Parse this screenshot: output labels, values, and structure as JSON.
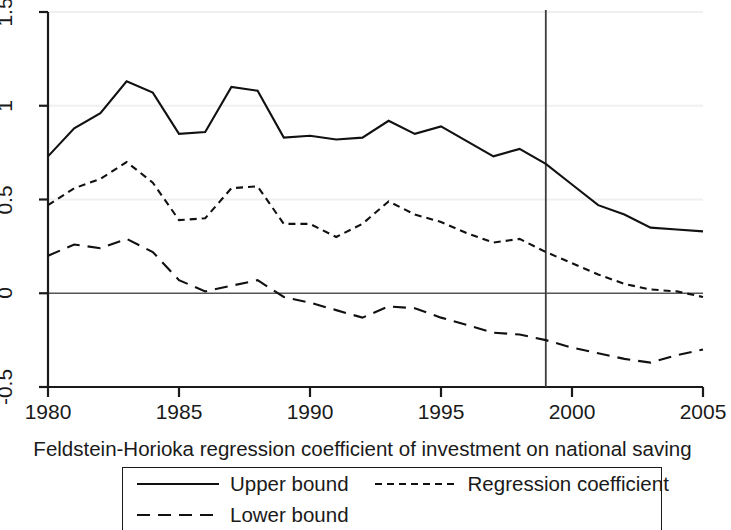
{
  "chart_data": {
    "type": "line",
    "title": "",
    "xlabel": "Feldstein-Horioka regression coefficient of investment on national saving",
    "ylabel": "",
    "xlim": [
      1980,
      2005
    ],
    "ylim": [
      -0.5,
      1.5
    ],
    "grid": true,
    "legend_position": "bottom",
    "xticks": [
      "1980",
      "1985",
      "1990",
      "1995",
      "2000",
      "2005"
    ],
    "xtick_values": [
      1980,
      1985,
      1990,
      1995,
      2000,
      2005
    ],
    "yticks": [
      "1.5",
      "1",
      "0.5",
      "0",
      "-0.5"
    ],
    "ytick_values": [
      1.5,
      1,
      0.5,
      0,
      -0.5
    ],
    "gridline_values": [
      1.5,
      1,
      0.5,
      -0.5
    ],
    "zero_line_value": 0,
    "reference_line": {
      "x": 1999,
      "label": ""
    },
    "x": [
      1980,
      1981,
      1982,
      1983,
      1984,
      1985,
      1986,
      1987,
      1988,
      1989,
      1990,
      1991,
      1992,
      1993,
      1994,
      1995,
      1996,
      1997,
      1998,
      1999,
      2000,
      2001,
      2002,
      2003,
      2004,
      2005
    ],
    "series": [
      {
        "name": "Upper bound",
        "style": "solid",
        "values": [
          0.73,
          0.88,
          0.96,
          1.13,
          1.07,
          0.85,
          0.86,
          1.1,
          1.08,
          0.83,
          0.84,
          0.82,
          0.83,
          0.92,
          0.85,
          0.89,
          0.81,
          0.73,
          0.77,
          0.69,
          0.58,
          0.47,
          0.42,
          0.35,
          0.34,
          0.33
        ],
        "values_full": [
          0.73,
          0.88,
          0.96,
          1.13,
          1.07,
          0.85,
          0.86,
          1.1,
          1.08,
          0.83,
          0.84,
          0.82,
          0.83,
          0.92,
          0.85,
          0.89,
          0.81,
          0.73,
          0.77,
          0.69,
          0.58,
          0.47,
          0.42,
          0.35,
          0.34,
          0.33
        ]
      },
      {
        "name": "Regression coefficient",
        "style": "dotted",
        "values": [
          0.47,
          0.56,
          0.61,
          0.7,
          0.59,
          0.39,
          0.4,
          0.56,
          0.57,
          0.37,
          0.37,
          0.3,
          0.37,
          0.49,
          0.42,
          0.38,
          0.32,
          0.27,
          0.29,
          0.22,
          0.16,
          0.1,
          0.05,
          0.02,
          0.01,
          -0.02
        ]
      },
      {
        "name": "Lower bound",
        "style": "dashed",
        "values": [
          0.2,
          0.26,
          0.24,
          0.29,
          0.22,
          0.07,
          0.01,
          0.04,
          0.07,
          -0.02,
          -0.05,
          -0.09,
          -0.13,
          -0.07,
          -0.08,
          -0.13,
          -0.17,
          -0.21,
          -0.22,
          -0.25,
          -0.29,
          -0.32,
          -0.35,
          -0.37,
          -0.33,
          -0.3
        ]
      }
    ]
  },
  "series_points": {
    "upper": [
      [
        1980,
        0.73
      ],
      [
        1981,
        0.88
      ],
      [
        1982,
        0.96
      ],
      [
        1983,
        1.13
      ],
      [
        1984,
        1.07
      ],
      [
        1985,
        0.85
      ],
      [
        1986,
        0.86
      ],
      [
        1987,
        1.1
      ],
      [
        1988,
        1.08
      ],
      [
        1989,
        0.83
      ],
      [
        1990,
        0.84
      ],
      [
        1991,
        0.82
      ],
      [
        1992,
        0.83
      ],
      [
        1993,
        0.92
      ],
      [
        1994,
        0.85
      ],
      [
        1995,
        0.89
      ],
      [
        1996,
        0.81
      ],
      [
        1997,
        0.73
      ],
      [
        1998,
        0.77
      ],
      [
        1999,
        0.69
      ],
      [
        2000,
        0.58
      ],
      [
        2001,
        0.47
      ],
      [
        2002,
        0.42
      ],
      [
        2003,
        0.35
      ],
      [
        2004,
        0.34
      ],
      [
        2005,
        0.33
      ]
    ],
    "coefficient": [
      [
        1980,
        0.47
      ],
      [
        1981,
        0.56
      ],
      [
        1982,
        0.61
      ],
      [
        1983,
        0.7
      ],
      [
        1984,
        0.59
      ],
      [
        1985,
        0.39
      ],
      [
        1986,
        0.4
      ],
      [
        1987,
        0.56
      ],
      [
        1988,
        0.57
      ],
      [
        1989,
        0.37
      ],
      [
        1990,
        0.37
      ],
      [
        1991,
        0.3
      ],
      [
        1992,
        0.37
      ],
      [
        1993,
        0.49
      ],
      [
        1994,
        0.42
      ],
      [
        1995,
        0.38
      ],
      [
        1996,
        0.32
      ],
      [
        1997,
        0.27
      ],
      [
        1998,
        0.29
      ],
      [
        1999,
        0.22
      ],
      [
        2000,
        0.16
      ],
      [
        2001,
        0.1
      ],
      [
        2002,
        0.05
      ],
      [
        2003,
        0.02
      ],
      [
        2004,
        0.01
      ],
      [
        2005,
        -0.02
      ]
    ],
    "lower": [
      [
        1980,
        0.2
      ],
      [
        1981,
        0.26
      ],
      [
        1982,
        0.24
      ],
      [
        1983,
        0.29
      ],
      [
        1984,
        0.22
      ],
      [
        1985,
        0.07
      ],
      [
        1986,
        0.01
      ],
      [
        1987,
        0.04
      ],
      [
        1988,
        0.07
      ],
      [
        1989,
        -0.02
      ],
      [
        1990,
        -0.05
      ],
      [
        1991,
        -0.09
      ],
      [
        1992,
        -0.13
      ],
      [
        1993,
        -0.07
      ],
      [
        1994,
        -0.08
      ],
      [
        1995,
        -0.13
      ],
      [
        1996,
        -0.17
      ],
      [
        1997,
        -0.21
      ],
      [
        1998,
        -0.22
      ],
      [
        1999,
        -0.25
      ],
      [
        2000,
        -0.29
      ],
      [
        2001,
        -0.32
      ],
      [
        2002,
        -0.35
      ],
      [
        2003,
        -0.37
      ],
      [
        2004,
        -0.33
      ],
      [
        2005,
        -0.3
      ]
    ]
  },
  "axis": {
    "x_title": "Feldstein-Horioka regression coefficient of investment on national saving",
    "x_tick_labels": [
      "1980",
      "1985",
      "1990",
      "1995",
      "2000",
      "2005"
    ],
    "y_tick_labels": [
      "1.5",
      "1",
      "0.5",
      "0",
      "-0.5"
    ]
  },
  "legend": {
    "items": [
      {
        "label": "Upper bound",
        "style": "solid"
      },
      {
        "label": "Regression coefficient",
        "style": "dotted"
      },
      {
        "label": "Lower bound",
        "style": "dashed"
      }
    ]
  },
  "colors": {
    "line": "#111111",
    "axis": "#1a1a1a",
    "grid": "#f0f0f0",
    "zero": "#555555",
    "reference": "#3d3d3d",
    "background": "#ffffff"
  }
}
